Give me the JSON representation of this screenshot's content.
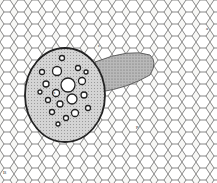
{
  "figure": {
    "labels": [
      {
        "id": "l1",
        "text": "B",
        "x": 3,
        "y": 174
      },
      {
        "id": "l2",
        "text": "a",
        "x": 206,
        "y": 29
      },
      {
        "id": "l3",
        "text": "c",
        "x": 98,
        "y": 46
      },
      {
        "id": "l4",
        "text": "p",
        "x": 136,
        "y": 127
      },
      {
        "id": "l5",
        "text": "x",
        "x": 53,
        "y": 93
      }
    ]
  }
}
